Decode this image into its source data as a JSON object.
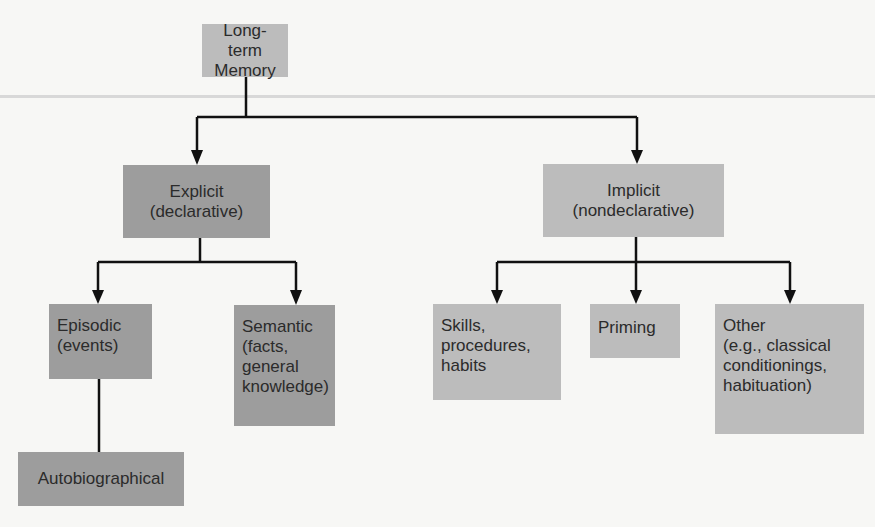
{
  "diagram": {
    "type": "hierarchy",
    "colors": {
      "light_box": "#bcbcbc",
      "dark_box": "#9d9d9d",
      "line": "#111111"
    },
    "root": {
      "id": "ltm",
      "label": "Long-term\nMemory"
    },
    "level1": [
      {
        "id": "explicit",
        "label": "Explicit\n(declarative)",
        "parent": "ltm"
      },
      {
        "id": "implicit",
        "label": "Implicit\n(nondeclarative)",
        "parent": "ltm"
      }
    ],
    "level2": [
      {
        "id": "episodic",
        "label": "Episodic\n(events)",
        "parent": "explicit"
      },
      {
        "id": "semantic",
        "label": "Semantic\n(facts,\ngeneral\nknowledge)",
        "parent": "explicit"
      },
      {
        "id": "skills",
        "label": "Skills,\nprocedures,\nhabits",
        "parent": "implicit"
      },
      {
        "id": "priming",
        "label": "Priming",
        "parent": "implicit"
      },
      {
        "id": "other",
        "label": "Other\n(e.g., classical\nconditionings,\nhabituation)",
        "parent": "implicit"
      }
    ],
    "level3": [
      {
        "id": "autobiographical",
        "label": "Autobiographical",
        "parent": "episodic"
      }
    ]
  }
}
